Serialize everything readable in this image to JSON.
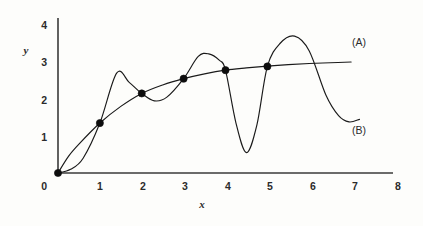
{
  "chart_data": {
    "type": "line",
    "title": "",
    "xlabel": "x",
    "ylabel": "y",
    "xlim": [
      0,
      8
    ],
    "ylim": [
      0,
      4.2
    ],
    "grid": false,
    "legend_position": "inline-right",
    "xticks": [
      "0",
      "1",
      "2",
      "3",
      "4",
      "5",
      "6",
      "7",
      "8"
    ],
    "xtick_values": [
      0,
      1,
      2,
      3,
      4,
      5,
      6,
      7,
      8
    ],
    "yticks": [
      "0",
      "1",
      "2",
      "3",
      "4"
    ],
    "ytick_values": [
      0,
      1,
      2,
      3,
      4
    ],
    "series": [
      {
        "name": "(A)",
        "label": "(A)",
        "description": "smooth monotonically increasing concave-down curve through the marked data points",
        "color": "#1a1a1a",
        "x": [
          0.0,
          0.25,
          0.5,
          1.0,
          1.5,
          2.0,
          2.5,
          3.0,
          3.5,
          4.0,
          4.5,
          5.0,
          5.5,
          6.0,
          6.5,
          7.0
        ],
        "y": [
          0.0,
          0.45,
          0.78,
          1.35,
          1.8,
          2.15,
          2.38,
          2.55,
          2.68,
          2.78,
          2.84,
          2.89,
          2.93,
          2.96,
          2.98,
          3.0
        ]
      },
      {
        "name": "(B)",
        "label": "(B)",
        "description": "oscillating interpolating curve that passes through the same data points but swings between them",
        "color": "#1a1a1a",
        "x": [
          0.0,
          0.3,
          0.6,
          1.0,
          1.4,
          1.7,
          2.0,
          2.3,
          2.6,
          3.0,
          3.35,
          3.6,
          3.85,
          4.0,
          4.25,
          4.5,
          4.75,
          5.0,
          5.3,
          5.65,
          6.0,
          6.4,
          6.7,
          6.95,
          7.2
        ],
        "y": [
          0.0,
          0.1,
          0.4,
          1.35,
          2.7,
          2.45,
          2.15,
          1.95,
          2.05,
          2.55,
          3.15,
          3.22,
          3.05,
          2.78,
          1.35,
          0.55,
          1.3,
          2.88,
          3.5,
          3.7,
          3.3,
          2.1,
          1.55,
          1.38,
          1.45
        ]
      }
    ],
    "markers": {
      "shape": "circle",
      "color": "#0d0d0d",
      "points": [
        {
          "x": 0,
          "y": 0.0
        },
        {
          "x": 1,
          "y": 1.35
        },
        {
          "x": 2,
          "y": 2.15
        },
        {
          "x": 3,
          "y": 2.55
        },
        {
          "x": 4,
          "y": 2.78
        },
        {
          "x": 5,
          "y": 2.88
        }
      ]
    },
    "annotations": [
      {
        "text": "(A)",
        "x": 7.3,
        "y": 3.35
      },
      {
        "text": "(B)",
        "x": 7.3,
        "y": 1.05
      }
    ]
  }
}
